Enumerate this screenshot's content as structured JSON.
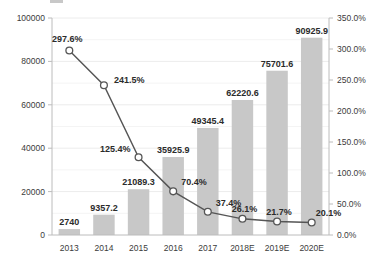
{
  "chart_data": {
    "type": "bar",
    "title": "",
    "subtitle": "",
    "xlabel": "",
    "ylabel": "",
    "categories": [
      "2013",
      "2014",
      "2015",
      "2016",
      "2017",
      "2018E",
      "2019E",
      "2020E"
    ],
    "series": [
      {
        "name": "bar-series",
        "type": "bar",
        "axis": "left",
        "values": [
          2740,
          9357.2,
          21089.3,
          35925.9,
          49345.4,
          62220.6,
          75701.6,
          90925.9
        ],
        "labels": [
          "2740",
          "9357.2",
          "21089.3",
          "35925.9",
          "49345.4",
          "62220.6",
          "75701.6",
          "90925.9"
        ],
        "color": "#c8c8c8"
      },
      {
        "name": "growth-rate-line",
        "type": "line",
        "axis": "right",
        "values": [
          297.6,
          241.5,
          125.4,
          70.4,
          37.4,
          26.1,
          21.7,
          20.1
        ],
        "labels": [
          "297.6%",
          "241.5%",
          "125.4%",
          "70.4%",
          "37.4%",
          "26.1%",
          "21.7%",
          "20.1%"
        ],
        "color": "#555555",
        "marker": "open-circle"
      }
    ],
    "left_axis": {
      "min": 0,
      "max": 100000,
      "ticks": [
        0,
        20000,
        40000,
        60000,
        80000,
        100000
      ],
      "tick_labels": [
        "0",
        "20000",
        "40000",
        "60000",
        "80000",
        "100000"
      ],
      "minor_ticks": [
        10000,
        30000,
        50000,
        70000,
        90000
      ]
    },
    "right_axis": {
      "min": 0,
      "max": 350,
      "ticks": [
        0,
        50,
        100,
        150,
        200,
        250,
        300,
        350
      ],
      "tick_labels": [
        "0.0%",
        "50.0%",
        "100.0%",
        "150.0%",
        "200.0%",
        "250.0%",
        "300.0%",
        "350.0%"
      ]
    },
    "grid": true,
    "legend": {
      "position": "top",
      "visible": true,
      "swatch_color": "#c8c8c8",
      "entries": [
        ""
      ]
    }
  }
}
